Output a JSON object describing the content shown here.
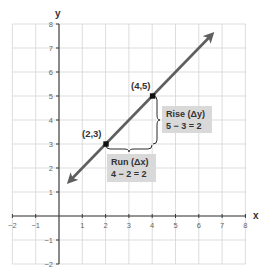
{
  "chart_data": {
    "type": "line",
    "title": "",
    "xlabel": "x",
    "ylabel": "y",
    "xlim": [
      -2,
      8
    ],
    "ylim": [
      -2,
      8
    ],
    "grid": true,
    "x_ticks": [
      -2,
      -1,
      1,
      2,
      3,
      4,
      5,
      6,
      7,
      8
    ],
    "y_ticks": [
      -2,
      -1,
      1,
      2,
      3,
      4,
      5,
      6,
      7,
      8
    ],
    "x_tick_labels": [
      "−2",
      "−1",
      "1",
      "2",
      "3",
      "4",
      "5",
      "6",
      "7",
      "8"
    ],
    "y_tick_labels": [
      "−2",
      "−1",
      "1",
      "2",
      "3",
      "4",
      "5",
      "6",
      "7",
      "8"
    ],
    "series": [
      {
        "name": "line y = x + 1",
        "x": [
          0.5,
          6.5
        ],
        "y": [
          1.5,
          7.5
        ],
        "arrows": "both",
        "color": "#5f5f5f"
      }
    ],
    "points": [
      {
        "x": 2,
        "y": 3,
        "label": "(2,3)"
      },
      {
        "x": 4,
        "y": 5,
        "label": "(4,5)"
      }
    ],
    "annotations": [
      {
        "type": "brace",
        "orientation": "horizontal",
        "from": [
          2,
          3
        ],
        "to": [
          4,
          3
        ],
        "label_line1": "Run (Δx)",
        "label_line2": "4 − 2 = 2"
      },
      {
        "type": "brace",
        "orientation": "vertical",
        "from": [
          4,
          3
        ],
        "to": [
          4,
          5
        ],
        "label_line1": "Rise (Δy)",
        "label_line2": "5 − 3 = 2"
      }
    ]
  },
  "labels": {
    "x_axis": "x",
    "y_axis": "y",
    "point_a": "(2,3)",
    "point_b": "(4,5)",
    "run_line1": "Run (Δx)",
    "run_line2": "4 − 2 = 2",
    "rise_line1": "Rise (Δy)",
    "rise_line2": "5 − 3 = 2",
    "x_ticks": [
      "−2",
      "−1",
      "1",
      "2",
      "3",
      "4",
      "5",
      "6",
      "7",
      "8"
    ],
    "y_ticks": [
      "−2",
      "−1",
      "1",
      "2",
      "3",
      "4",
      "5",
      "6",
      "7",
      "8"
    ]
  },
  "colors": {
    "line": "#5f5f5f",
    "point": "#111111",
    "box": "#d9d9d9",
    "grid": "#d4d4d4",
    "axis": "#3a3a3a"
  }
}
